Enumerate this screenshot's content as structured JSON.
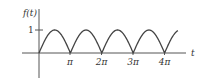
{
  "chart_data": {
    "type": "line",
    "title": "",
    "function": "|sin t|",
    "xlabel": "t",
    "ylabel": "f(t)",
    "x_ticks": [
      {
        "value": 3.14159,
        "label": "π"
      },
      {
        "value": 6.28318,
        "label": "2π"
      },
      {
        "value": 9.42478,
        "label": "3π"
      },
      {
        "value": 12.56637,
        "label": "4π"
      }
    ],
    "y_ticks": [
      {
        "value": 1,
        "label": "1"
      }
    ],
    "xlim": [
      -0.5,
      14.8
    ],
    "ylim": [
      -0.9,
      1.6
    ],
    "grid": false,
    "series": [
      {
        "name": "f(t) = |sin t|",
        "x": [
          0,
          0.785,
          1.571,
          2.356,
          3.142,
          3.927,
          4.712,
          5.498,
          6.283,
          7.069,
          7.854,
          8.639,
          9.425,
          10.21,
          10.996,
          11.781,
          12.566,
          13.352,
          14.137
        ],
        "values": [
          0,
          0.707,
          1,
          0.707,
          0,
          0.707,
          1,
          0.707,
          0,
          0.707,
          1,
          0.707,
          0,
          0.707,
          1,
          0.707,
          0,
          0.707,
          1
        ]
      }
    ]
  },
  "labels": {
    "y_axis": "f(t)",
    "x_axis": "t",
    "y_tick_1": "1",
    "x_tick_pi": "π",
    "x_tick_2pi": "2π",
    "x_tick_3pi": "3π",
    "x_tick_4pi": "4π"
  },
  "colors": {
    "axis": "#555555",
    "curve": "#444444",
    "text": "#333333"
  }
}
